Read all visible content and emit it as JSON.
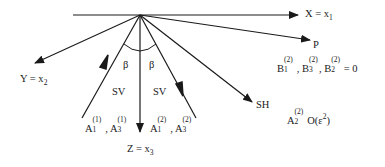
{
  "diagram": {
    "axes": {
      "x": {
        "label": "X = x",
        "subscript": "1"
      },
      "y": {
        "label": "Y = x",
        "subscript": "2"
      },
      "z": {
        "label": "Z = x",
        "subscript": "3"
      }
    },
    "angles": {
      "left": "β",
      "right": "β"
    },
    "waves": {
      "sv_left": {
        "label": "SV",
        "amplitudes": {
          "a": "A",
          "a_sub": "1",
          "a_sup": "(1)",
          "sep": ",",
          "b": "A",
          "b_sub": "3",
          "b_sup": "(1)"
        }
      },
      "sv_right": {
        "label": "SV",
        "amplitudes": {
          "a": "A",
          "a_sub": "1",
          "a_sup": "(2)",
          "sep": ",",
          "b": "A",
          "b_sub": "3",
          "b_sup": "(2)"
        }
      },
      "sh": {
        "label": "SH",
        "amplitude": {
          "a": "A",
          "a_sub": "2",
          "a_sup": "(2)",
          "order": "O(ε",
          "order_sup": "2",
          "order_close": ")"
        }
      },
      "p": {
        "label": "P",
        "amplitudes": {
          "b1": "B",
          "b1_sub": "1",
          "b1_sup": "(2)",
          "sep1": ",",
          "b3": "B",
          "b3_sub": "3",
          "b3_sup": "(2)",
          "sep2": ",",
          "b2": "B",
          "b2_sub": "2",
          "b2_sup": "(2)",
          "eq": "= 0"
        }
      }
    },
    "colors": {
      "line": "#1a1a1a",
      "background": "#ffffff"
    }
  }
}
